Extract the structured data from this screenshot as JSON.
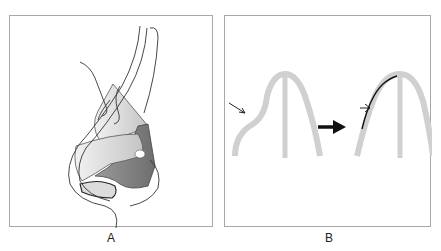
{
  "figure": {
    "panels": [
      {
        "id": "A",
        "label": "A",
        "description": "Lateral view line drawing of a nose showing internal cartilage structures (shaded gray regions) with sutures/strands"
      },
      {
        "id": "B",
        "label": "B",
        "description": "Gray arch-shaped cartilage with a deformity (left thin arrow), big black arrow pointing to corrected arch with a black line graft and small arrow"
      }
    ],
    "colors": {
      "border": "#a8a8a8",
      "cartilage_light": "#d6d6d6",
      "cartilage_dark": "#8a8a8a",
      "line": "#333333",
      "arch": "#d0d0d0",
      "arrow": "#111111"
    }
  }
}
